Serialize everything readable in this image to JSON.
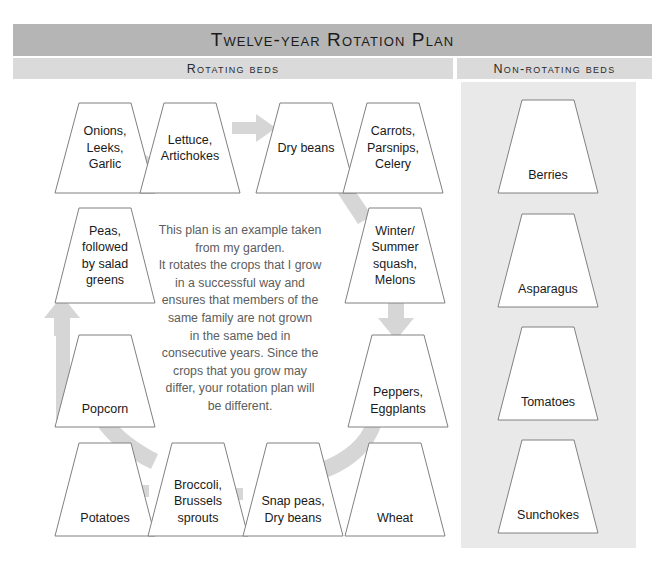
{
  "header": {
    "title": "Twelve-year Rotation Plan",
    "left_column_label": "Rotating beds",
    "right_column_label": "Non-rotating beds"
  },
  "colors": {
    "title_bar": "#b5b5b5",
    "sub_bar": "#dadada",
    "nonrotating_panel": "#e9e9e9",
    "arrow": "#d6d6d6",
    "bed_outline": "#808080",
    "bed_fill": "#ffffff",
    "note_text": "#5d5d5d"
  },
  "note": {
    "lines": [
      "This plan is an example taken",
      "from my garden.",
      "It rotates the crops that I grow",
      "in a successful way and",
      "ensures that members of the",
      "same family are not grown",
      "in the same bed in",
      "consecutive years. Since the",
      "crops that you grow may",
      "differ, your rotation plan will",
      "be different."
    ]
  },
  "rotating_beds": [
    {
      "id": "onions",
      "label": "Onions,\nLeeks,\nGarlic",
      "order": 1
    },
    {
      "id": "lettuce",
      "label": "Lettuce,\nArtichokes",
      "order": 2
    },
    {
      "id": "drybeans",
      "label": "Dry beans",
      "order": 3
    },
    {
      "id": "carrots",
      "label": "Carrots,\nParsnips,\nCelery",
      "order": 4
    },
    {
      "id": "squash",
      "label": "Winter/\nSummer\nsquash,\nMelons",
      "order": 5
    },
    {
      "id": "peppers",
      "label": "Peppers,\nEggplants",
      "order": 6
    },
    {
      "id": "wheat",
      "label": "Wheat",
      "order": 7
    },
    {
      "id": "snappeas",
      "label": "Snap peas,\nDry beans",
      "order": 8
    },
    {
      "id": "broccoli",
      "label": "Broccoli,\nBrussels\nsprouts",
      "order": 9
    },
    {
      "id": "potatoes",
      "label": "Potatoes",
      "order": 10
    },
    {
      "id": "popcorn",
      "label": "Popcorn",
      "order": 11
    },
    {
      "id": "peas",
      "label": "Peas,\nfollowed\nby salad\ngreens",
      "order": 12
    }
  ],
  "non_rotating_beds": [
    {
      "id": "berries",
      "label": "Berries"
    },
    {
      "id": "asparagus",
      "label": "Asparagus"
    },
    {
      "id": "tomatoes",
      "label": "Tomatoes"
    },
    {
      "id": "sunchokes",
      "label": "Sunchokes"
    }
  ]
}
